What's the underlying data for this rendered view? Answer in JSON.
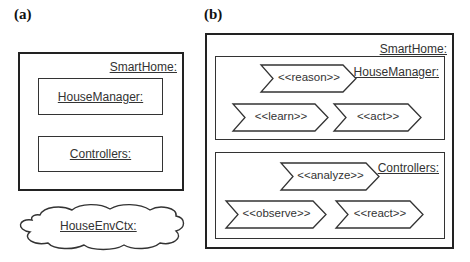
{
  "panel_a": {
    "label": "(a)",
    "smarthome": {
      "title": "SmartHome:"
    },
    "housemanager": {
      "title": "HouseManager:"
    },
    "controllers": {
      "title": "Controllers:"
    },
    "environment": {
      "title": "HouseEnvCtx:"
    }
  },
  "panel_b": {
    "label": "(b)",
    "smarthome": {
      "title": "SmartHome:"
    },
    "housemanager": {
      "title": "HouseManager:",
      "activities": [
        "<<reason>>",
        "<<learn>>",
        "<<act>>"
      ]
    },
    "controllers": {
      "title": "Controllers:",
      "activities": [
        "<<analyze>>",
        "<<observe>>",
        "<<react>>"
      ]
    }
  }
}
